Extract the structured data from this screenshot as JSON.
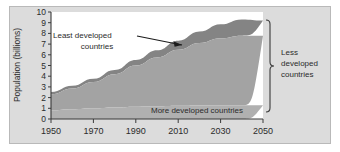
{
  "chart_data": {
    "type": "area",
    "title": "",
    "subtitle": "",
    "xlabel": "",
    "ylabel": "Population (billions)",
    "xlim": [
      1950,
      2050
    ],
    "ylim": [
      0,
      10
    ],
    "grid": false,
    "legend_position": "inline-annotations",
    "xticks": [
      "1950",
      "1970",
      "1990",
      "2010",
      "2030",
      "2050"
    ],
    "xtick_values": [
      1950,
      1970,
      1990,
      2010,
      2030,
      2050
    ],
    "yticks": [
      "0",
      "1",
      "2",
      "3",
      "4",
      "5",
      "6",
      "7",
      "8",
      "9",
      "10"
    ],
    "ytick_values": [
      0,
      1,
      2,
      3,
      4,
      5,
      6,
      7,
      8,
      9,
      10
    ],
    "x": [
      1950,
      1960,
      1970,
      1980,
      1990,
      2000,
      2010,
      2020,
      2030,
      2040,
      2050
    ],
    "stacked": true,
    "series": [
      {
        "name": "More developed countries",
        "color": "#b0b0b0",
        "values": [
          0.81,
          0.92,
          1.01,
          1.08,
          1.15,
          1.19,
          1.24,
          1.27,
          1.29,
          1.29,
          1.28
        ]
      },
      {
        "name": "Less developed countries",
        "color": "#a3a3a3",
        "values": [
          1.51,
          1.94,
          2.45,
          3.11,
          3.85,
          4.56,
          5.23,
          5.84,
          6.26,
          6.5,
          6.5
        ]
      },
      {
        "name": "Least developed countries",
        "color": "#848484",
        "values": [
          0.2,
          0.25,
          0.31,
          0.4,
          0.52,
          0.67,
          0.85,
          1.06,
          1.3,
          1.52,
          1.42
        ]
      }
    ],
    "totals": [
      2.52,
      3.11,
      3.77,
      4.59,
      5.52,
      6.42,
      7.32,
      8.17,
      8.85,
      9.31,
      9.2
    ],
    "annotations": [
      {
        "name": "least-developed-label",
        "text_line1": "Least developed",
        "text_line2": "countries",
        "pointer": "arrow-to-upper-band"
      },
      {
        "name": "more-developed-label",
        "text": "More developed countries"
      },
      {
        "name": "less-developed-bracket-label",
        "text_line1": "Less",
        "text_line2": "developed",
        "text_line3": "countries",
        "pointer": "right-brace"
      }
    ],
    "colors": {
      "panel_background": "#dcdcdc",
      "plot_background": "#ffffff",
      "more_developed_band": "#b0b0b0",
      "less_developed_band": "#a3a3a3",
      "least_developed_band": "#848484",
      "axis": "#3a3a3a",
      "text": "#2b2b2b"
    }
  }
}
